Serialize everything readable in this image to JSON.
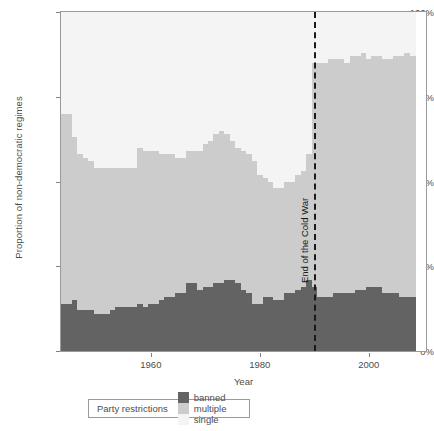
{
  "chart_data": {
    "type": "area",
    "title": "",
    "subtitle": "",
    "xlabel": "Year",
    "ylabel": "Proportion of non-democratic regimes",
    "xlim": [
      1944,
      2008
    ],
    "ylim": [
      0,
      100
    ],
    "grid": false,
    "legend_position": "bottom",
    "legend_title": "Party restrictions",
    "stacked": true,
    "value_unit": "percent",
    "colors": {
      "banned": "#636363",
      "multiple": "#cccccc",
      "single": "#f4f4f4",
      "panel_border": "#9a9a9a",
      "annotation": "#1a1a1a",
      "text": "#4d4d4d"
    },
    "y_ticks": [
      {
        "value": 0,
        "label": "0%"
      },
      {
        "value": 25,
        "label": "25%"
      },
      {
        "value": 50,
        "label": "50%"
      },
      {
        "value": 75,
        "label": "75%"
      },
      {
        "value": 100,
        "label": "100%"
      }
    ],
    "x_ticks": [
      {
        "value": 1960,
        "label": "1960"
      },
      {
        "value": 1980,
        "label": "1980"
      },
      {
        "value": 2000,
        "label": "2000"
      }
    ],
    "annotations": [
      {
        "type": "vline",
        "x": 1990,
        "label": "End of the Cold War",
        "style": "dashed",
        "rotation": -90
      }
    ],
    "x": [
      1944,
      1945,
      1946,
      1947,
      1948,
      1949,
      1950,
      1951,
      1952,
      1953,
      1954,
      1955,
      1956,
      1957,
      1958,
      1959,
      1960,
      1961,
      1962,
      1963,
      1964,
      1965,
      1966,
      1967,
      1968,
      1969,
      1970,
      1971,
      1972,
      1973,
      1974,
      1975,
      1976,
      1977,
      1978,
      1979,
      1980,
      1981,
      1982,
      1983,
      1984,
      1985,
      1986,
      1987,
      1988,
      1989,
      1990,
      1991,
      1992,
      1993,
      1994,
      1995,
      1996,
      1997,
      1998,
      1999,
      2000,
      2001,
      2002,
      2003,
      2004,
      2005,
      2006,
      2007,
      2008
    ],
    "series": [
      {
        "name": "banned",
        "label": "banned",
        "color": "#636363",
        "values": [
          14,
          14,
          15,
          12,
          12,
          12,
          11,
          11,
          11,
          12,
          13,
          13,
          13,
          13,
          14,
          13,
          14,
          14,
          15,
          16,
          16,
          17,
          17,
          20,
          20,
          18,
          19,
          19,
          20,
          20,
          21,
          21,
          20,
          18,
          17,
          14,
          14,
          16,
          16,
          15,
          15,
          17,
          17,
          18,
          19,
          21,
          19,
          16,
          16,
          16,
          17,
          17,
          17,
          17,
          18,
          18,
          19,
          19,
          19,
          17,
          17,
          17,
          16,
          16,
          16
        ]
      },
      {
        "name": "multiple",
        "label": "multiple",
        "color": "#cccccc",
        "values": [
          56,
          56,
          48,
          46,
          45,
          44,
          43,
          43,
          43,
          42,
          41,
          41,
          41,
          41,
          46,
          46,
          45,
          45,
          43,
          42,
          42,
          40,
          40,
          39,
          39,
          41,
          42,
          43,
          44,
          45,
          43,
          41,
          40,
          41,
          41,
          42,
          38,
          35,
          34,
          33,
          33,
          33,
          33,
          34,
          34,
          37,
          66,
          69,
          69,
          70,
          69,
          69,
          68,
          70,
          69,
          70,
          67,
          68,
          68,
          69,
          69,
          70,
          71,
          72,
          71
        ]
      },
      {
        "name": "single",
        "label": "single",
        "color": "#f4f4f4",
        "values": [
          30,
          30,
          37,
          42,
          43,
          44,
          46,
          46,
          46,
          46,
          46,
          46,
          46,
          46,
          40,
          41,
          41,
          41,
          42,
          42,
          42,
          43,
          43,
          41,
          41,
          41,
          39,
          38,
          36,
          35,
          36,
          38,
          40,
          41,
          42,
          44,
          48,
          49,
          50,
          52,
          52,
          50,
          50,
          48,
          47,
          42,
          15,
          15,
          15,
          14,
          14,
          14,
          15,
          13,
          13,
          12,
          14,
          13,
          13,
          14,
          14,
          13,
          13,
          12,
          13
        ]
      }
    ]
  },
  "axes": {
    "ylabel": "Proportion of non-democratic regimes",
    "xlabel": "Year"
  },
  "legend": {
    "title": "Party restrictions",
    "items": [
      {
        "label": "banned",
        "color": "#636363"
      },
      {
        "label": "multiple",
        "color": "#cccccc"
      },
      {
        "label": "single",
        "color": "#f4f4f4"
      }
    ]
  },
  "annotation": {
    "cold_war_label": "End of the Cold War"
  }
}
